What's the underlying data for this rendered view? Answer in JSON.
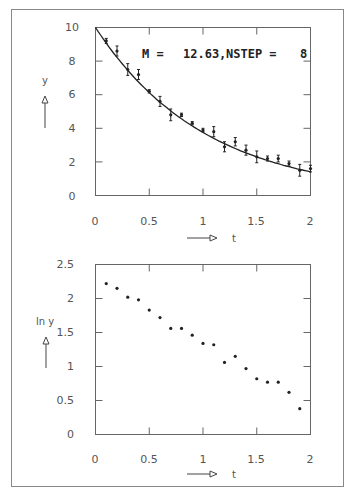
{
  "chart_data": [
    {
      "type": "scatter",
      "title": "",
      "annotation": "M =   12.63, NSTEP =    8",
      "xlabel": "t",
      "ylabel": "y",
      "xlim": [
        0,
        2
      ],
      "ylim": [
        0,
        10
      ],
      "xticks": [
        "0",
        "0.5",
        "1",
        "1.5",
        "2"
      ],
      "yticks": [
        "0",
        "2",
        "4",
        "6",
        "8",
        "10"
      ],
      "grid": false,
      "series": [
        {
          "name": "measurements",
          "style": "points-with-error-bars",
          "x": [
            0.1,
            0.2,
            0.3,
            0.4,
            0.5,
            0.6,
            0.7,
            0.8,
            0.9,
            1.0,
            1.1,
            1.2,
            1.3,
            1.4,
            1.5,
            1.6,
            1.7,
            1.8,
            1.9,
            2.0
          ],
          "y": [
            9.2,
            8.6,
            7.5,
            7.2,
            6.2,
            5.6,
            4.8,
            4.8,
            4.3,
            3.9,
            3.8,
            2.9,
            3.2,
            2.7,
            2.3,
            2.2,
            2.2,
            1.9,
            1.5,
            1.6
          ],
          "yerr": [
            0.15,
            0.3,
            0.35,
            0.3,
            0.1,
            0.3,
            0.35,
            0.1,
            0.1,
            0.1,
            0.3,
            0.3,
            0.25,
            0.3,
            0.35,
            0.15,
            0.2,
            0.15,
            0.35,
            0.2
          ]
        },
        {
          "name": "fit",
          "style": "line",
          "function": "10*exp(-0.98*t)",
          "x": [
            0,
            0.25,
            0.5,
            0.75,
            1.0,
            1.25,
            1.5,
            1.75,
            2.0
          ],
          "y": [
            10.0,
            7.8,
            6.1,
            4.8,
            3.75,
            2.93,
            2.3,
            1.8,
            1.4
          ]
        }
      ]
    },
    {
      "type": "scatter",
      "title": "",
      "xlabel": "t",
      "ylabel": "ln y",
      "xlim": [
        0,
        2
      ],
      "ylim": [
        0,
        2.5
      ],
      "xticks": [
        "0",
        "0.5",
        "1",
        "1.5",
        "2"
      ],
      "yticks": [
        "0",
        "0.5",
        "1",
        "1.5",
        "2",
        "2.5"
      ],
      "grid": false,
      "series": [
        {
          "name": "ln y",
          "style": "points",
          "x": [
            0.1,
            0.2,
            0.3,
            0.4,
            0.5,
            0.6,
            0.7,
            0.8,
            0.9,
            1.0,
            1.1,
            1.2,
            1.3,
            1.4,
            1.5,
            1.6,
            1.7,
            1.8,
            1.9
          ],
          "y": [
            2.22,
            2.15,
            2.02,
            1.98,
            1.83,
            1.72,
            1.56,
            1.56,
            1.46,
            1.34,
            1.32,
            1.06,
            1.15,
            0.97,
            0.82,
            0.77,
            0.77,
            0.62,
            0.38,
            0.46
          ]
        }
      ]
    }
  ],
  "top_plot": {
    "annotation_label": "M =",
    "annotation_m": "12.63,",
    "annotation_nstep_label": "NSTEP =",
    "annotation_nstep": "8",
    "ylabel": "y",
    "xlabel": "t",
    "xticks": [
      "0",
      "0.5",
      "1",
      "1.5",
      "2"
    ],
    "yticks": [
      "0",
      "2",
      "4",
      "6",
      "8",
      "10"
    ]
  },
  "bottom_plot": {
    "ylabel": "ln  y",
    "xlabel": "t",
    "xticks": [
      "0",
      "0.5",
      "1",
      "1.5",
      "2"
    ],
    "yticks": [
      "0",
      "0.5",
      "1",
      "1.5",
      "2",
      "2.5"
    ]
  },
  "colors": {
    "frame": "#555555",
    "ink": "#222222",
    "text": "#555555"
  }
}
